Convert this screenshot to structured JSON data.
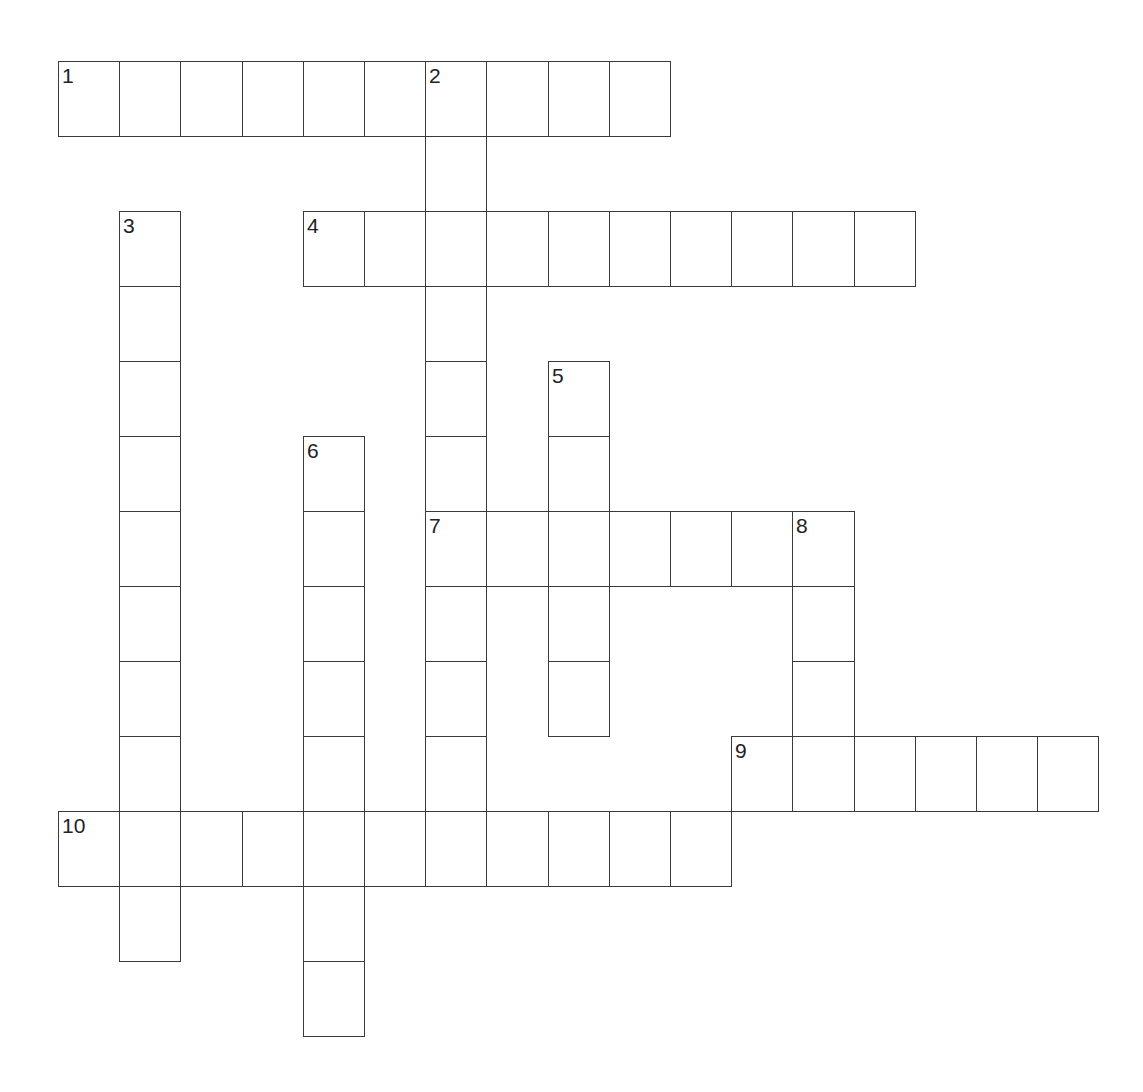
{
  "puzzle": {
    "type": "crossword",
    "grid": {
      "origin_x": 58,
      "origin_y": 61,
      "cell_width": 61.2,
      "cell_height": 75,
      "line_color": "#3a3a3a",
      "number_color": "#222222",
      "background": "#ffffff"
    },
    "entries": [
      {
        "number": "1",
        "direction": "across",
        "row": 0,
        "col": 0,
        "length": 10
      },
      {
        "number": "2",
        "direction": "down",
        "row": 0,
        "col": 6,
        "length": 11
      },
      {
        "number": "3",
        "direction": "down",
        "row": 2,
        "col": 1,
        "length": 10
      },
      {
        "number": "4",
        "direction": "across",
        "row": 2,
        "col": 4,
        "length": 10
      },
      {
        "number": "5",
        "direction": "down",
        "row": 4,
        "col": 8,
        "length": 5
      },
      {
        "number": "6",
        "direction": "down",
        "row": 5,
        "col": 4,
        "length": 8
      },
      {
        "number": "7",
        "direction": "across",
        "row": 6,
        "col": 6,
        "length": 7
      },
      {
        "number": "8",
        "direction": "down",
        "row": 6,
        "col": 12,
        "length": 4
      },
      {
        "number": "9",
        "direction": "across",
        "row": 9,
        "col": 11,
        "length": 6
      },
      {
        "number": "10",
        "direction": "across",
        "row": 10,
        "col": 0,
        "length": 11
      }
    ]
  }
}
